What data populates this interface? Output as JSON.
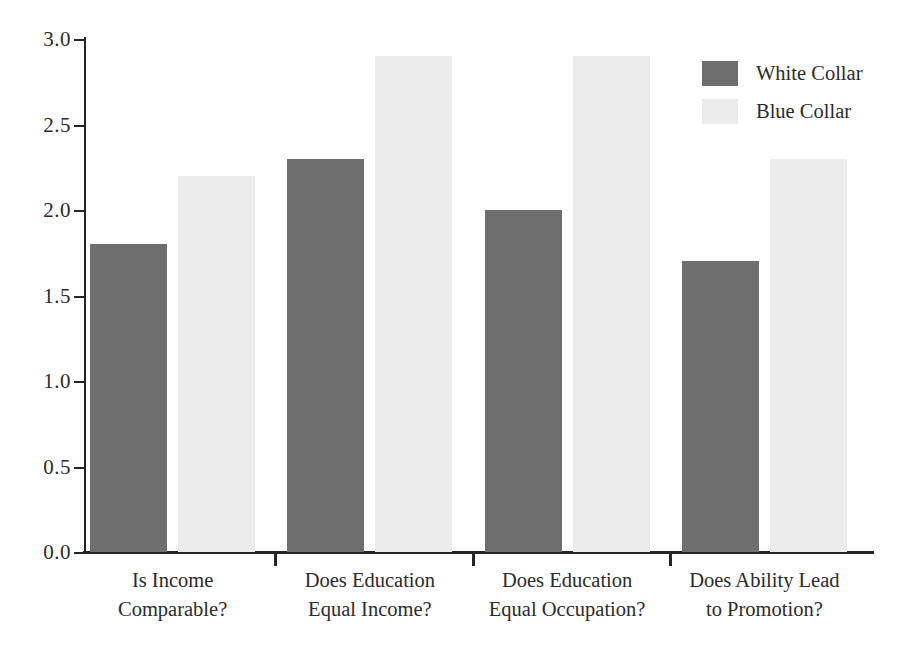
{
  "chart_data": {
    "type": "bar",
    "title": "",
    "subtitle": "",
    "xlabel": "",
    "ylabel": "",
    "ylim": [
      0.0,
      3.0
    ],
    "ytick_labels": [
      "0.0",
      "0.5",
      "1.0",
      "1.5",
      "2.0",
      "2.5",
      "3.0"
    ],
    "ytick_values": [
      0.0,
      0.5,
      1.0,
      1.5,
      2.0,
      2.5,
      3.0
    ],
    "grid": false,
    "legend_position": "top-right",
    "categories": [
      "Is Income\nComparable?",
      "Does Education\nEqual Income?",
      "Does Education\nEqual Occupation?",
      "Does Ability Lead\nto Promotion?"
    ],
    "series": [
      {
        "name": "White Collar",
        "color": "#6e6e6e",
        "values": [
          1.8,
          2.3,
          2.0,
          1.7
        ]
      },
      {
        "name": "Blue Collar",
        "color": "#ebebeb",
        "values": [
          2.2,
          2.9,
          2.9,
          2.3
        ]
      }
    ]
  },
  "legend": {
    "items": [
      {
        "label": "White Collar",
        "color": "#6e6e6e"
      },
      {
        "label": "Blue Collar",
        "color": "#ebebeb"
      }
    ]
  },
  "axis": {
    "color": "#252525"
  }
}
